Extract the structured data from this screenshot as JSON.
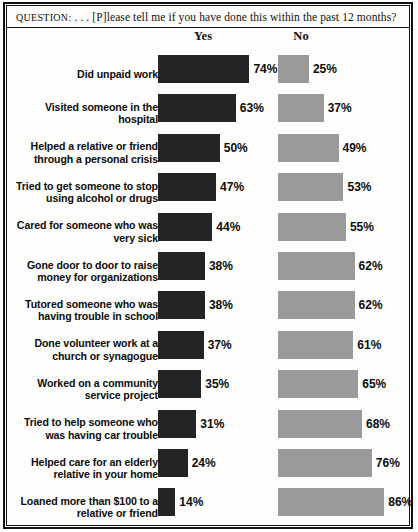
{
  "question": {
    "prefix": "QUESTION:",
    "body": " . . . [P]lease tell me if you have done this within the past 12 months?"
  },
  "headers": {
    "yes": "Yes",
    "no": "No"
  },
  "colors": {
    "yes_bar": "#242424",
    "no_bar": "#9a9a9a",
    "frame": "#111111",
    "background": "#fdfdfb"
  },
  "chart_data": {
    "type": "bar",
    "title": "QUESTION: . . . [P]lease tell me if you have done this within the past 12 months?",
    "xlabel": "",
    "ylabel": "",
    "orientation": "horizontal",
    "grid": false,
    "legend_position": "top",
    "xlim": [
      0,
      100
    ],
    "categories": [
      "Did unpaid work",
      "Visited someone in the hospital",
      "Helped a relative or friend through a personal crisis",
      "Tried to get someone to stop using alcohol or drugs",
      "Cared for someone who was very sick",
      "Gone door to door to raise money for organizations",
      "Tutored someone who was having trouble in school",
      "Done volunteer work at a church or synagogue",
      "Worked on a community service project",
      "Tried to help someone who was having car trouble",
      "Helped care for an elderly relative in your home",
      "Loaned more than $100 to a relative or friend"
    ],
    "series": [
      {
        "name": "Yes",
        "values": [
          74,
          63,
          50,
          47,
          44,
          38,
          38,
          37,
          35,
          31,
          24,
          14
        ],
        "color": "#242424"
      },
      {
        "name": "No",
        "values": [
          25,
          37,
          49,
          53,
          55,
          62,
          62,
          61,
          65,
          68,
          76,
          86
        ],
        "color": "#9a9a9a"
      }
    ]
  },
  "rows": [
    {
      "label_lines": [
        "Did unpaid work"
      ],
      "yes": 74,
      "no": 25,
      "yes_label": "74%",
      "no_label": "25%"
    },
    {
      "label_lines": [
        "Visited someone in the",
        "hospital"
      ],
      "yes": 63,
      "no": 37,
      "yes_label": "63%",
      "no_label": "37%"
    },
    {
      "label_lines": [
        "Helped a relative or friend",
        "through a personal crisis"
      ],
      "yes": 50,
      "no": 49,
      "yes_label": "50%",
      "no_label": "49%"
    },
    {
      "label_lines": [
        "Tried to get someone to stop",
        "using alcohol or drugs"
      ],
      "yes": 47,
      "no": 53,
      "yes_label": "47%",
      "no_label": "53%"
    },
    {
      "label_lines": [
        "Cared for someone who was",
        "very sick"
      ],
      "yes": 44,
      "no": 55,
      "yes_label": "44%",
      "no_label": "55%"
    },
    {
      "label_lines": [
        "Gone door to door to raise",
        "money for organizations"
      ],
      "yes": 38,
      "no": 62,
      "yes_label": "38%",
      "no_label": "62%"
    },
    {
      "label_lines": [
        "Tutored someone who was",
        "having trouble in school"
      ],
      "yes": 38,
      "no": 62,
      "yes_label": "38%",
      "no_label": "62%"
    },
    {
      "label_lines": [
        "Done volunteer work at a",
        "church or synagogue"
      ],
      "yes": 37,
      "no": 61,
      "yes_label": "37%",
      "no_label": "61%"
    },
    {
      "label_lines": [
        "Worked on a community",
        "service project"
      ],
      "yes": 35,
      "no": 65,
      "yes_label": "35%",
      "no_label": "65%"
    },
    {
      "label_lines": [
        "Tried to help someone who",
        "was having car trouble"
      ],
      "yes": 31,
      "no": 68,
      "yes_label": "31%",
      "no_label": "68%"
    },
    {
      "label_lines": [
        "Helped care for an elderly",
        "relative in your home"
      ],
      "yes": 24,
      "no": 76,
      "yes_label": "24%",
      "no_label": "76%"
    },
    {
      "label_lines": [
        "Loaned more than $100 to a",
        "relative or friend"
      ],
      "yes": 14,
      "no": 86,
      "yes_label": "14%",
      "no_label": "86%"
    }
  ]
}
